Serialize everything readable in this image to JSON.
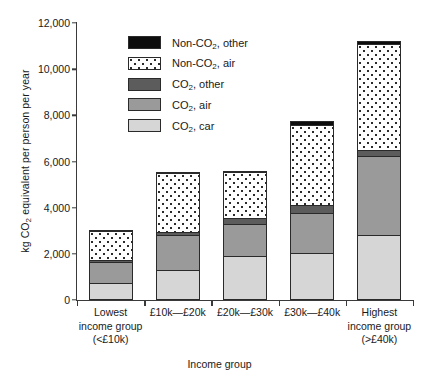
{
  "chart_data": {
    "type": "bar",
    "subtype": "stacked",
    "title": "",
    "xlabel": "Income group",
    "ylabel": "kg CO2 equivalent per person per year",
    "ylim": [
      0,
      12000
    ],
    "ytick_values": [
      0,
      2000,
      4000,
      6000,
      8000,
      10000,
      12000
    ],
    "ytick_labels": [
      "0",
      "2,000",
      "4,000",
      "6,000",
      "8,000",
      "10,000",
      "12,000"
    ],
    "grid": false,
    "legend_position": "upper-left-inside",
    "categories": [
      "Lowest income group (<£10k)",
      "£10k—£20k",
      "£20k—£30k",
      "£30k—£40k",
      "Highest income group (>£40k)"
    ],
    "category_lines": [
      [
        "Lowest",
        "income group",
        "(<£10k)"
      ],
      [
        "£10k—£20k"
      ],
      [
        "£20k—£30k"
      ],
      [
        "£30k—£40k"
      ],
      [
        "Highest",
        "income group",
        "(>£40k)"
      ]
    ],
    "series": [
      {
        "name": "CO2, car",
        "color": "#d6d6d6",
        "values": [
          650,
          1200,
          1800,
          1950,
          2750
        ]
      },
      {
        "name": "CO2, air",
        "color": "#9a9a9a",
        "values": [
          900,
          1550,
          1400,
          1750,
          3400
        ]
      },
      {
        "name": "CO2, other",
        "color": "#5c5c5c",
        "values": [
          100,
          100,
          250,
          350,
          250
        ]
      },
      {
        "name": "Non-CO2, air",
        "color": "#ffffff",
        "values": [
          1250,
          2550,
          2000,
          3450,
          4600
        ]
      },
      {
        "name": "Non-CO2, other",
        "color": "#0d0d0d",
        "values": [
          50,
          50,
          50,
          150,
          150
        ]
      }
    ],
    "totals": [
      2950,
      5450,
      5500,
      7650,
      11150
    ]
  },
  "legend": {
    "items": [
      {
        "label_prefix": "Non-CO",
        "label_sub": "2",
        "label_suffix": ", other",
        "swatch": "sw-nonother"
      },
      {
        "label_prefix": "Non-CO",
        "label_sub": "2",
        "label_suffix": ", air",
        "swatch": "sw-nonair"
      },
      {
        "label_prefix": "CO",
        "label_sub": "2",
        "label_suffix": ", other",
        "swatch": "sw-other"
      },
      {
        "label_prefix": "CO",
        "label_sub": "2",
        "label_suffix": ", air",
        "swatch": "sw-air"
      },
      {
        "label_prefix": "CO",
        "label_sub": "2",
        "label_suffix": ", car",
        "swatch": "sw-car"
      }
    ]
  },
  "axis_titles": {
    "y_prefix": "kg CO",
    "y_sub": "2",
    "y_suffix": " equivalent per person per year",
    "x": "Income group"
  }
}
